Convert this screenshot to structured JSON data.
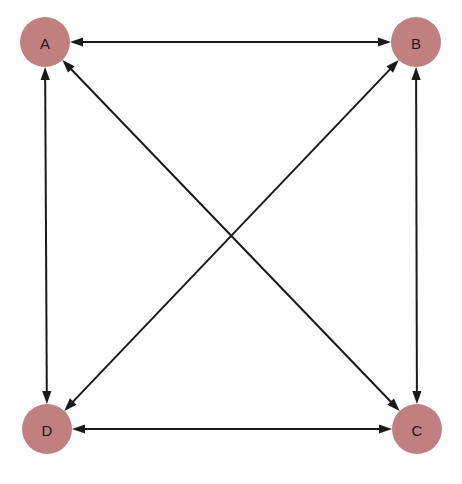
{
  "diagram": {
    "title": "",
    "type": "directed-graph",
    "background_color": "#fefefe",
    "node_fill_color": "#c08080",
    "node_label_color": "#2b1414",
    "edge_color": "#1a1a1a",
    "edge_width": 2,
    "node_radius": 25,
    "nodes": [
      {
        "id": "A",
        "label": "A",
        "cx": 45,
        "cy": 42
      },
      {
        "id": "B",
        "label": "B",
        "cx": 416,
        "cy": 42
      },
      {
        "id": "C",
        "label": "C",
        "cx": 417,
        "cy": 429
      },
      {
        "id": "D",
        "label": "D",
        "cx": 47,
        "cy": 429
      }
    ],
    "edges": [
      {
        "from": "A",
        "to": "B",
        "direction": "both",
        "kind": "top"
      },
      {
        "from": "A",
        "to": "D",
        "direction": "both",
        "kind": "left"
      },
      {
        "from": "B",
        "to": "C",
        "direction": "both",
        "kind": "right"
      },
      {
        "from": "D",
        "to": "C",
        "direction": "both",
        "kind": "bottom"
      },
      {
        "from": "A",
        "to": "C",
        "direction": "both",
        "kind": "diagonal"
      },
      {
        "from": "B",
        "to": "D",
        "direction": "both",
        "kind": "diagonal"
      }
    ]
  }
}
